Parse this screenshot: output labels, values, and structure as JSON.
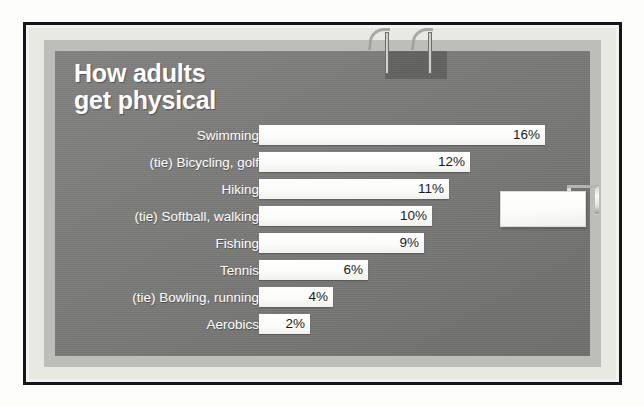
{
  "chart_data": {
    "type": "bar",
    "orientation": "horizontal",
    "title": "How adults\nget physical",
    "xlabel": "",
    "ylabel": "",
    "grid": false,
    "legend": false,
    "value_suffix": "%",
    "xlim": [
      0,
      16
    ],
    "categories": [
      "Swimming",
      "(tie) Bicycling, golf",
      "Hiking",
      "(tie) Softball, walking",
      "Fishing",
      "Tennis",
      "(tie) Bowling, running",
      "Aerobics"
    ],
    "values": [
      16,
      12,
      11,
      10,
      9,
      6,
      4,
      2
    ],
    "value_labels": [
      "16%",
      "12%",
      "11%",
      "10%",
      "9%",
      "6%",
      "4%",
      "2%"
    ],
    "bars": [
      {
        "label": "Swimming",
        "value": 16,
        "value_label": "16%",
        "bar_width_px": 286
      },
      {
        "label": "(tie) Bicycling, golf",
        "value": 12,
        "value_label": "12%",
        "bar_width_px": 211
      },
      {
        "label": "Hiking",
        "value": 11,
        "value_label": "11%",
        "bar_width_px": 190
      },
      {
        "label": "(tie) Softball, walking",
        "value": 10,
        "value_label": "10%",
        "bar_width_px": 173
      },
      {
        "label": "Fishing",
        "value": 9,
        "value_label": "9%",
        "bar_width_px": 165
      },
      {
        "label": "Tennis",
        "value": 6,
        "value_label": "6%",
        "bar_width_px": 109
      },
      {
        "label": "(tie) Bowling, running",
        "value": 4,
        "value_label": "4%",
        "bar_width_px": 74
      },
      {
        "label": "Aerobics",
        "value": 2,
        "value_label": "2%",
        "bar_width_px": 51
      }
    ]
  },
  "colors": {
    "board_background": "#7a7a78",
    "bar_fill": "#ffffff",
    "label_text": "#ffffff",
    "value_text": "#1b1b1b",
    "frame_border": "#16161a",
    "mat_light": "#e9e9e4",
    "mat_mid": "#bdbdb9",
    "page_background": "#fdfdfc"
  },
  "decor": {
    "clips": [
      "top-clip-left",
      "top-clip-right"
    ],
    "tag": {
      "name": "blank-tag",
      "text": ""
    }
  }
}
